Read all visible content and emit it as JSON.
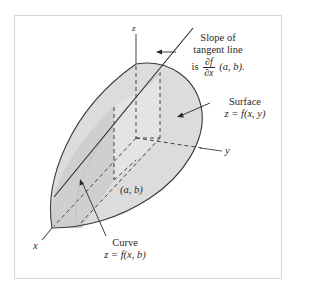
{
  "figure": {
    "axes": {
      "x_label": "x",
      "y_label": "y",
      "z_label": "z"
    },
    "point_label": "(a, b)",
    "annotations": {
      "tangent": {
        "line1": "Slope of",
        "line2": "tangent line",
        "prefix": "is",
        "frac_num": "∂f",
        "frac_den": "∂x",
        "suffix": "(a, b)."
      },
      "surface": {
        "line1": "Surface",
        "line2": "z = f(x, y)"
      },
      "curve": {
        "line1": "Curve",
        "line2": "z = f(x, b)"
      }
    },
    "colors": {
      "surface_fill": "#d9d9d9",
      "surface_fill_light": "#e6e6e6",
      "outline": "#3a3a3a",
      "axis": "#555555",
      "frame": "#d6d6d6"
    }
  }
}
